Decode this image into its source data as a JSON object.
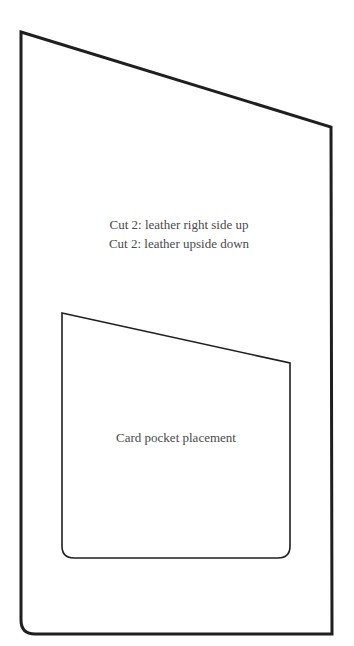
{
  "pattern": {
    "outer_piece": {
      "instructions": [
        "Cut 2: leather right side up",
        "Cut 2: leather upside down"
      ]
    },
    "inner_piece": {
      "label": "Card pocket placement"
    },
    "colors": {
      "outline": "#1f1f1f",
      "text": "#4a4a4a",
      "background": "#ffffff"
    }
  }
}
